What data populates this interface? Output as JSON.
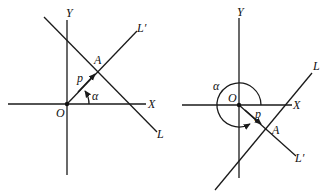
{
  "figure": {
    "left": {
      "labels": {
        "y_axis": "Y",
        "x_axis": "X",
        "origin": "O",
        "line": "L",
        "normal_line": "L′",
        "foot": "A",
        "distance": "p",
        "angle": "α"
      }
    },
    "right": {
      "labels": {
        "y_axis": "Y",
        "x_axis": "X",
        "origin": "O",
        "line": "L",
        "normal_line": "L′",
        "foot": "A",
        "distance": "p",
        "angle": "α"
      }
    }
  }
}
